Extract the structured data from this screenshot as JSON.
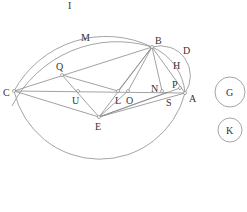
{
  "diagram": {
    "type": "geometry-construction",
    "points": {
      "A": {
        "label": "A",
        "x": 185,
        "y": 93,
        "lx": 189,
        "ly": 102
      },
      "B": {
        "label": "B",
        "x": 152,
        "y": 47,
        "lx": 155,
        "ly": 44
      },
      "C": {
        "label": "C",
        "x": 14,
        "y": 91,
        "lx": 3,
        "ly": 96
      },
      "E": {
        "label": "E",
        "x": 99,
        "y": 117,
        "lx": 95,
        "ly": 130
      },
      "L": {
        "label": "L",
        "x": 118,
        "y": 91,
        "lx": 115,
        "ly": 104
      },
      "O": {
        "label": "O",
        "x": 128,
        "y": 91,
        "lx": 126,
        "ly": 104
      },
      "N": {
        "label": "N",
        "x": 162,
        "y": 91,
        "lx": 151,
        "ly": 92
      },
      "P": {
        "label": "P",
        "x": 180,
        "y": 88,
        "lx": 172,
        "ly": 88
      },
      "S": {
        "label": "S",
        "x": 168,
        "y": 92,
        "lx": 166,
        "ly": 106
      },
      "Q": {
        "label": "Q",
        "x": 62,
        "y": 75,
        "lx": 56,
        "ly": 70
      },
      "U": {
        "label": "U",
        "x": 78,
        "y": 91,
        "lx": 72,
        "ly": 104
      }
    },
    "arc_labels": {
      "I": {
        "label": "I",
        "x": 68,
        "y": 9
      },
      "M": {
        "label": "M",
        "x": 81,
        "y": 41
      },
      "D": {
        "label": "D",
        "x": 183,
        "y": 54
      },
      "H": {
        "label": "H",
        "x": 173,
        "y": 69
      }
    },
    "circles": {
      "G": {
        "label": "G",
        "cx": 230,
        "cy": 92,
        "r": 15
      },
      "K": {
        "label": "K",
        "cx": 230,
        "cy": 130,
        "r": 12
      }
    }
  }
}
